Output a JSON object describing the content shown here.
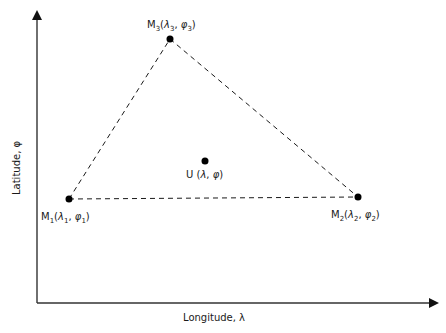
{
  "axes": {
    "x_label": "Longitude, λ",
    "y_label": "Latitude, φ"
  },
  "points": {
    "M1": {
      "name": "M",
      "sub": "1",
      "lambda": "λ",
      "lambda_sub": "1",
      "phi": "φ",
      "phi_sub": "1",
      "label": "M1(λ1, φ1)"
    },
    "M2": {
      "name": "M",
      "sub": "2",
      "lambda": "λ",
      "lambda_sub": "2",
      "phi": "φ",
      "phi_sub": "2",
      "label": "M2(λ2, φ2)"
    },
    "M3": {
      "name": "M",
      "sub": "3",
      "lambda": "λ",
      "lambda_sub": "3",
      "phi": "φ",
      "phi_sub": "3",
      "label": "M3(λ3, φ3)"
    },
    "U": {
      "name": "U",
      "label": "U (λ, φ)",
      "text_prefix": "U (",
      "lambda": "λ",
      "sep": ", ",
      "phi": "φ",
      "suffix": ")"
    }
  },
  "punct": {
    "open": "(",
    "sep": ", ",
    "close": ")"
  },
  "colors": {
    "line": "#1a1a1a",
    "axis": "#333333"
  }
}
